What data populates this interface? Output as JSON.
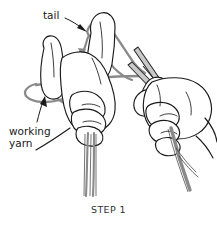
{
  "illustration": {
    "title": "Knitting long-tail cast-on illustration",
    "caption": "STEP 1",
    "annotations": [
      {
        "id": "tail",
        "label": "tail",
        "x": 43,
        "y": 10
      },
      {
        "id": "working-yarn",
        "label": "working\nyarn",
        "x": 9,
        "y": 126
      }
    ],
    "colors": {
      "background": "#ffffff",
      "outline": "#1a1a1a",
      "yarn": "#8a8a8a",
      "yarn_shadow": "#6e6e6e",
      "needle_fill": "#c9c9c9",
      "needle_outline": "#2b2b2b",
      "text": "#1a1a1a",
      "caption_text": "#333333"
    },
    "scene": {
      "left_hand": "open left hand, palm toward viewer, thumb extended left, yarn looped around thumb and index finger",
      "right_hand": "right hand pinching two knitting needles with thumb and index finger",
      "needles": 2,
      "hanging_strands_left": 2,
      "hanging_strand_right": 1
    }
  }
}
